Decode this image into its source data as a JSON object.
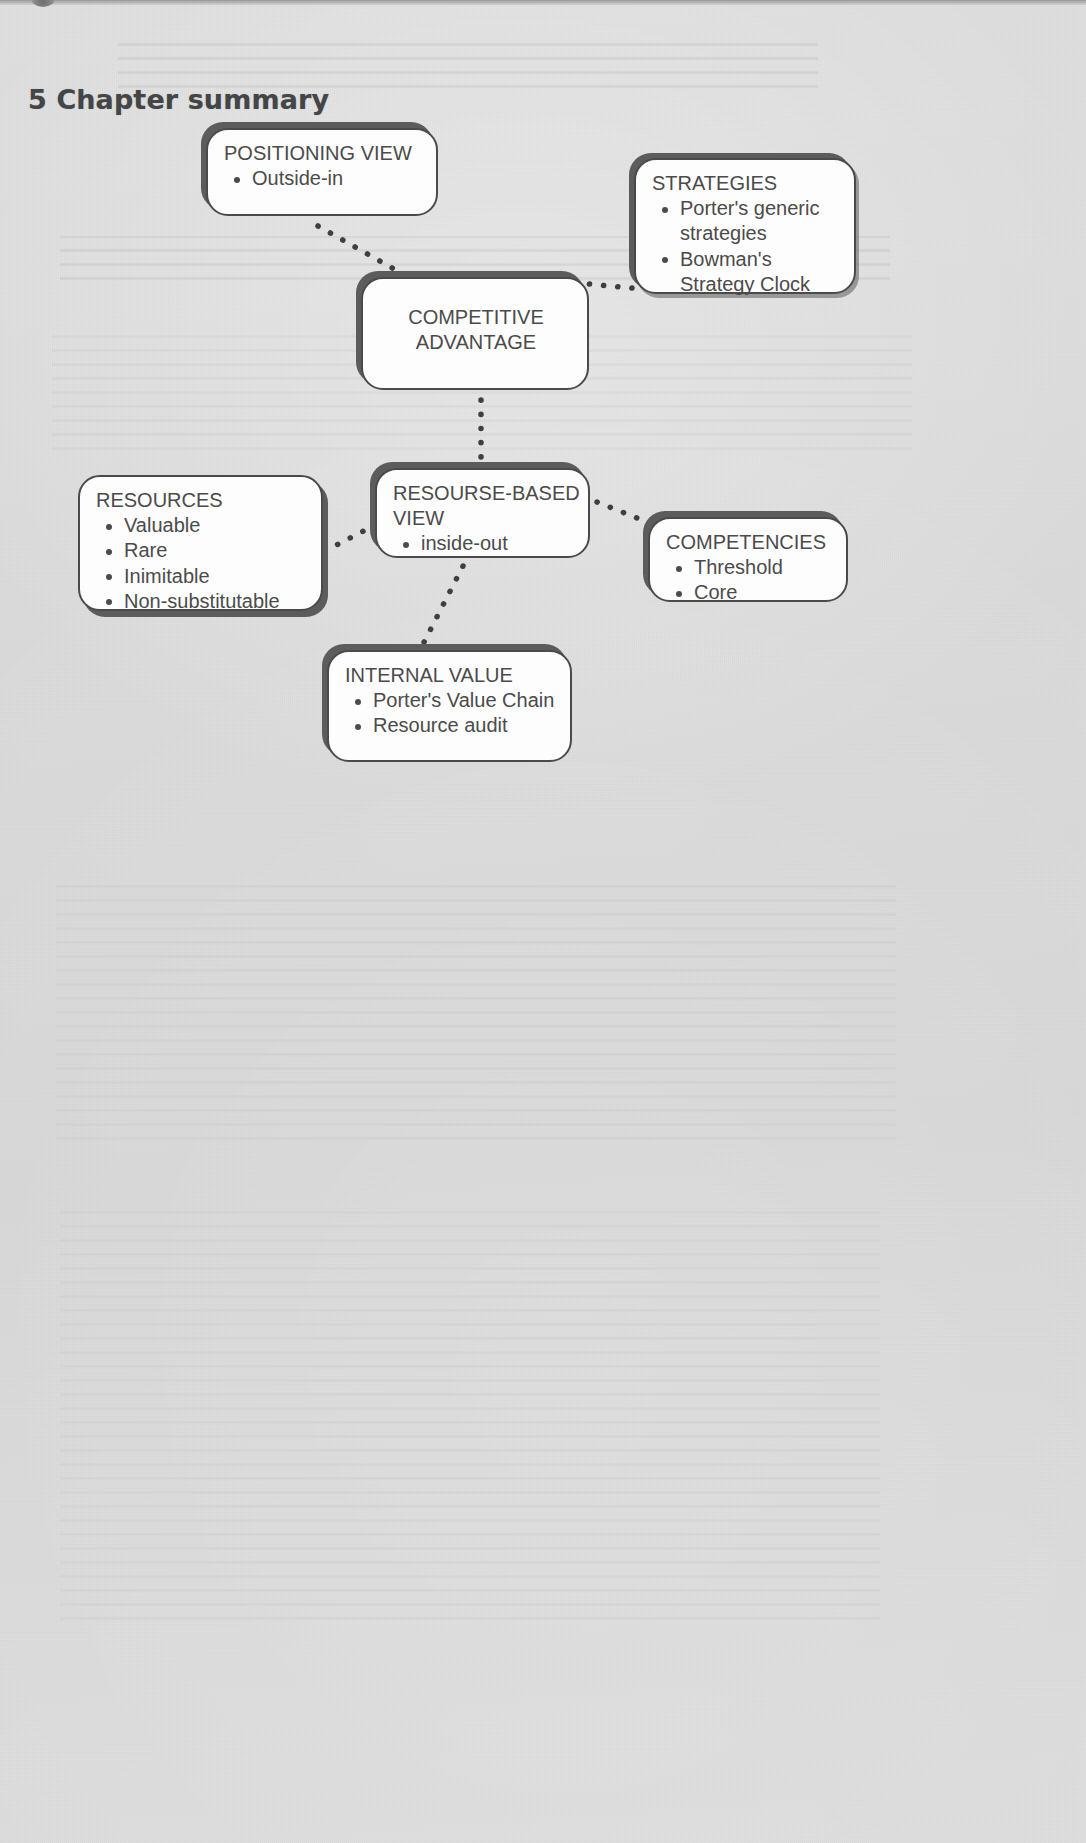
{
  "page": {
    "heading": "5 Chapter summary",
    "background_color": "#dadada",
    "node_fill_color": "#fdfdfd",
    "node_stroke_color": "#4a4a4a",
    "node_shadow_color": "#5c5c5c",
    "text_color": "#4b4b4b"
  },
  "diagram": {
    "type": "mind-map",
    "nodes": [
      {
        "id": "positioning-view",
        "title": "POSITIONING VIEW",
        "items": [
          "Outside-in"
        ]
      },
      {
        "id": "strategies",
        "title": "STRATEGIES",
        "items": [
          "Porter's generic strategies",
          "Bowman's Strategy Clock"
        ]
      },
      {
        "id": "competitive-advantage",
        "title": "COMPETITIVE ADVANTAGE",
        "title_line_1": "COMPETITIVE",
        "title_line_2": "ADVANTAGE",
        "items": []
      },
      {
        "id": "resourse-based-view",
        "title": "RESOURSE-BASED VIEW",
        "title_line_1": "RESOURSE-BASED",
        "title_line_2": "VIEW",
        "items": [
          "inside-out"
        ]
      },
      {
        "id": "resources",
        "title": "RESOURCES",
        "items": [
          "Valuable",
          "Rare",
          "Inimitable",
          "Non-substitutable"
        ]
      },
      {
        "id": "competencies",
        "title": "COMPETENCIES",
        "items": [
          "Threshold",
          "Core"
        ]
      },
      {
        "id": "internal-value",
        "title": "INTERNAL VALUE",
        "items": [
          "Porter's Value Chain",
          "Resource audit"
        ]
      }
    ],
    "connections": [
      {
        "from": "positioning-view",
        "to": "competitive-advantage",
        "style": "dotted"
      },
      {
        "from": "strategies",
        "to": "competitive-advantage",
        "style": "dotted"
      },
      {
        "from": "competitive-advantage",
        "to": "resourse-based-view",
        "style": "dotted"
      },
      {
        "from": "resources",
        "to": "resourse-based-view",
        "style": "dotted"
      },
      {
        "from": "resourse-based-view",
        "to": "competencies",
        "style": "dotted"
      },
      {
        "from": "resourse-based-view",
        "to": "internal-value",
        "style": "dotted"
      }
    ]
  }
}
